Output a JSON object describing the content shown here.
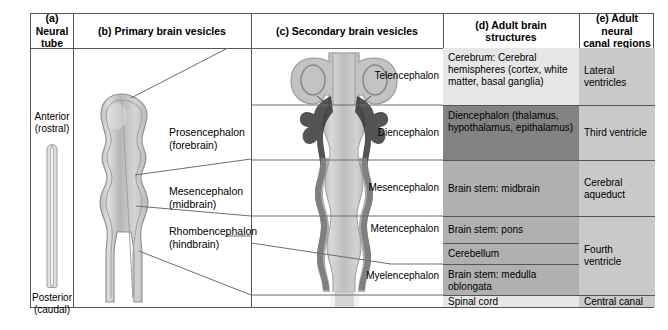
{
  "columns": [
    {
      "id": "a",
      "header": "(a) Neural\ntube",
      "header_line1": "(a) Neural",
      "header_line2": "tube"
    },
    {
      "id": "b",
      "header": "(b) Primary brain vesicles"
    },
    {
      "id": "c",
      "header": "(c) Secondary brain vesicles"
    },
    {
      "id": "d",
      "header_line1": "(d) Adult brain",
      "header_line2": "structures"
    },
    {
      "id": "e",
      "header_line1": "(e) Adult neural",
      "header_line2": "canal regions"
    }
  ],
  "neural_tube": {
    "anterior_line1": "Anterior",
    "anterior_line2": "(rostral)",
    "posterior_line1": "Posterior",
    "posterior_line2": "(caudal)"
  },
  "primary_vesicles": [
    {
      "line1": "Prosencephalon",
      "line2": "(forebrain)"
    },
    {
      "line1": "Mesencephalon",
      "line2": "(midbrain)"
    },
    {
      "line1": "Rhombencephalon",
      "line2": "(hindbrain)"
    }
  ],
  "secondary_vesicles": [
    {
      "label": "Telencephalon"
    },
    {
      "label": "Diencephalon"
    },
    {
      "label": "Mesencephalon"
    },
    {
      "label": "Metencephalon"
    },
    {
      "label": "Myelencephalon"
    }
  ],
  "adult_brain_structures": [
    {
      "text": "Cerebrum: Cerebral hemispheres (cortex, white matter, basal ganglia)",
      "color": "#e6e6e6"
    },
    {
      "text": "Diencephalon (thalamus, hypothalamus, epithalamus)",
      "color": "#838383"
    },
    {
      "text": "Brain stem: midbrain",
      "color": "#b0b0b0"
    },
    {
      "text": "Brain stem: pons",
      "color": "#b0b0b0"
    },
    {
      "text": "Cerebellum",
      "color": "#b0b0b0"
    },
    {
      "text": "Brain stem: medulla oblongata",
      "color": "#b0b0b0"
    },
    {
      "text": "Spinal cord",
      "color": "#e6e6e6"
    }
  ],
  "adult_neural_canal_regions": [
    {
      "text": "Lateral ventricles",
      "color": "#c9c9c9"
    },
    {
      "text": "Third ventricle",
      "color": "#c9c9c9"
    },
    {
      "text": "Cerebral aqueduct",
      "color": "#c9c9c9"
    },
    {
      "text": "Fourth ventricle",
      "color": "#c9c9c9"
    },
    {
      "text": "Central canal",
      "color": "#c9c9c9"
    }
  ],
  "colors": {
    "border": "#555555",
    "guide": "#6d6d6d",
    "cell_light": "#e6e6e6",
    "cell_mid": "#b0b0b0",
    "cell_dark": "#838383",
    "cell_ventricle": "#c9c9c9",
    "tissue_light": "#cacaca",
    "tissue_outline": "#8e8e8e",
    "canal_dark": "#2b2b2b"
  }
}
